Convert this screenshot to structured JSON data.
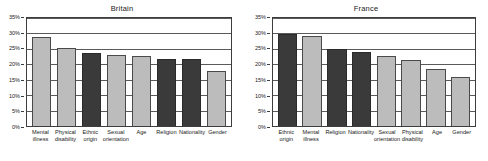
{
  "chart_data": [
    {
      "type": "bar",
      "title": "Britain",
      "xlabel": "",
      "ylabel": "",
      "ylim": [
        0,
        35
      ],
      "grid": true,
      "legend": "none",
      "ytick_labels": [
        "35%",
        "30%",
        "25%",
        "20%",
        "15%",
        "10%",
        "5%",
        "0%"
      ],
      "ytick_values": [
        35,
        30,
        25,
        20,
        15,
        10,
        5,
        0
      ],
      "categories": [
        "Mental illness",
        "Physical disability",
        "Ethnic origin",
        "Sexual orientation",
        "Age",
        "Religion",
        "Nationality",
        "Gender"
      ],
      "values": [
        28.8,
        25.4,
        23.7,
        23.0,
        22.8,
        21.7,
        21.6,
        17.9
      ],
      "bar_shades": [
        "light",
        "light",
        "dark",
        "light",
        "light",
        "dark",
        "dark",
        "light"
      ]
    },
    {
      "type": "bar",
      "title": "France",
      "xlabel": "",
      "ylabel": "",
      "ylim": [
        0,
        35
      ],
      "grid": true,
      "legend": "none",
      "ytick_labels": [
        "35%",
        "30%",
        "25%",
        "20%",
        "15%",
        "10%",
        "5%",
        "0%"
      ],
      "ytick_values": [
        35,
        30,
        25,
        20,
        15,
        10,
        5,
        0
      ],
      "categories": [
        "Ethnic origin",
        "Mental illness",
        "Religion",
        "Nationality",
        "Sexual orientation",
        "Physical disability",
        "Age",
        "Gender"
      ],
      "values": [
        29.9,
        29.2,
        24.9,
        23.9,
        22.6,
        21.5,
        18.4,
        15.9
      ],
      "bar_shades": [
        "dark",
        "light",
        "dark",
        "dark",
        "light",
        "light",
        "light",
        "light"
      ]
    }
  ],
  "colors": {
    "light_bar": "#bcbcbc",
    "dark_bar": "#3a3a3a",
    "axis": "#3d3d3d",
    "gridline": "#5a5a5a",
    "text": "#1a1a1a",
    "background": "#ffffff"
  }
}
